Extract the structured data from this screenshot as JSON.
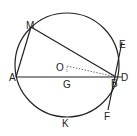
{
  "diagram": {
    "type": "geometry",
    "labels": {
      "M": "M",
      "E": "E",
      "O": "O",
      "A": "A",
      "G": "G",
      "B": "B",
      "D": "D",
      "K": "K",
      "F": "F"
    },
    "colors": {
      "stroke": "#222222",
      "background": "#ffffff"
    }
  }
}
